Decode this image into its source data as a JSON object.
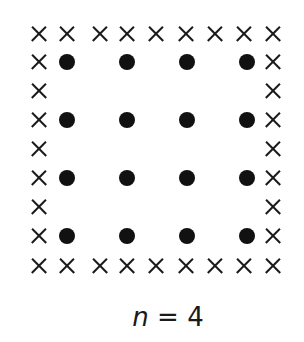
{
  "figure": {
    "label": {
      "variable": "n",
      "equals": "=",
      "value": "4"
    },
    "n": 4,
    "border_symbol": "cross-mark",
    "interior_symbol": "filled-dot",
    "colors": {
      "ink": "#111111",
      "background": "#ffffff"
    },
    "border": {
      "top": [
        [
          39,
          34
        ],
        [
          67,
          34
        ],
        [
          100,
          34
        ],
        [
          127,
          34
        ],
        [
          156,
          34
        ],
        [
          186,
          34
        ],
        [
          215,
          34
        ],
        [
          244,
          34
        ],
        [
          273,
          34
        ]
      ],
      "bottom": [
        [
          39,
          266
        ],
        [
          67,
          266
        ],
        [
          100,
          266
        ],
        [
          127,
          266
        ],
        [
          156,
          266
        ],
        [
          186,
          266
        ],
        [
          215,
          266
        ],
        [
          244,
          266
        ],
        [
          273,
          266
        ]
      ],
      "left": [
        [
          39,
          62
        ],
        [
          39,
          91
        ],
        [
          39,
          120
        ],
        [
          39,
          149
        ],
        [
          39,
          178
        ],
        [
          39,
          207
        ],
        [
          39,
          236
        ]
      ],
      "right": [
        [
          273,
          62
        ],
        [
          273,
          91
        ],
        [
          273,
          120
        ],
        [
          273,
          149
        ],
        [
          273,
          178
        ],
        [
          273,
          207
        ],
        [
          273,
          236
        ]
      ]
    },
    "dots": [
      [
        67,
        62
      ],
      [
        127,
        62
      ],
      [
        187,
        62
      ],
      [
        247,
        62
      ],
      [
        67,
        120
      ],
      [
        127,
        120
      ],
      [
        187,
        120
      ],
      [
        247,
        120
      ],
      [
        67,
        178
      ],
      [
        127,
        178
      ],
      [
        187,
        178
      ],
      [
        247,
        178
      ],
      [
        67,
        236
      ],
      [
        127,
        236
      ],
      [
        187,
        236
      ],
      [
        247,
        236
      ]
    ],
    "counts": {
      "crosses": 32,
      "dots": 16
    }
  }
}
